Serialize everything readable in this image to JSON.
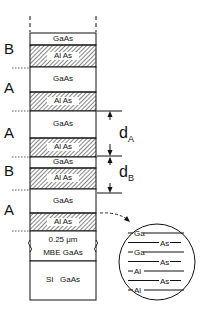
{
  "diagram": {
    "type": "superlattice-layer-stack",
    "layers": [
      {
        "material": "GaAs",
        "top": 33,
        "bottom": 45,
        "hatched": false
      },
      {
        "material": "Al As",
        "top": 45,
        "bottom": 67,
        "hatched": true
      },
      {
        "material": "GaAs",
        "top": 67,
        "bottom": 92,
        "hatched": false
      },
      {
        "material": "Al As",
        "top": 92,
        "bottom": 111,
        "hatched": true
      },
      {
        "material": "GaAs",
        "top": 111,
        "bottom": 138,
        "hatched": false
      },
      {
        "material": "Al As",
        "top": 138,
        "bottom": 157,
        "hatched": true
      },
      {
        "material": "GaAs",
        "top": 157,
        "bottom": 168,
        "hatched": false
      },
      {
        "material": "Al As",
        "top": 168,
        "bottom": 189,
        "hatched": true
      },
      {
        "material": "GaAs",
        "top": 189,
        "bottom": 213,
        "hatched": false
      },
      {
        "material": "Al As",
        "top": 213,
        "bottom": 231,
        "hatched": true
      }
    ],
    "buffer": {
      "line1": "0.25 μm",
      "line2": "MBE  GaAs"
    },
    "substrate": {
      "label": "SI   GaAs"
    },
    "period_labels": [
      {
        "text": "B",
        "y": 49
      },
      {
        "text": "A",
        "y": 88
      },
      {
        "text": "A",
        "y": 133
      },
      {
        "text": "B",
        "y": 171
      },
      {
        "text": "A",
        "y": 210
      }
    ],
    "dimensions": {
      "dA": {
        "symbol": "d",
        "sub": "A"
      },
      "dB": {
        "symbol": "d",
        "sub": "B"
      }
    },
    "inset": {
      "rows": [
        {
          "text": "Ga",
          "pos": "left"
        },
        {
          "text": "As",
          "pos": "right"
        },
        {
          "text": "Ga",
          "pos": "left"
        },
        {
          "text": "As",
          "pos": "right"
        },
        {
          "text": "Al",
          "pos": "left"
        },
        {
          "text": "As",
          "pos": "right"
        },
        {
          "text": "Al",
          "pos": "left"
        }
      ]
    }
  }
}
